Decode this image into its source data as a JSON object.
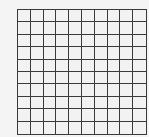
{
  "grid": {
    "rows": 10,
    "columns": 10,
    "line_color": "#3a3a3a",
    "cell_color": "#f2f2f2",
    "background": "#f4f4f4"
  }
}
